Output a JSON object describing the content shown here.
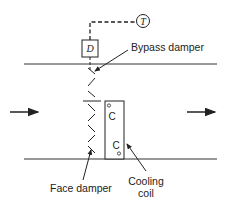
{
  "diagram": {
    "controller": {
      "thermostat_symbol": "T",
      "damper_actuator_symbol": "D"
    },
    "labels": {
      "bypass_damper": "Bypass damper",
      "face_damper": "Face damper",
      "cooling_coil_line1": "Cooling",
      "cooling_coil_line2": "coil"
    },
    "coil_marks": [
      "C",
      "C"
    ],
    "airflow": {
      "inlet": "left-to-right",
      "outlet": "left-to-right"
    },
    "colors": {
      "line": "#222222",
      "background": "#ffffff"
    }
  }
}
